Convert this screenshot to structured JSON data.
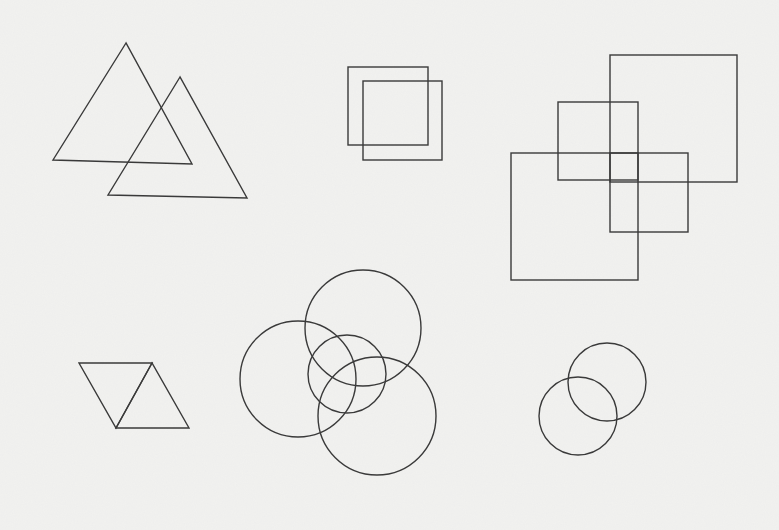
{
  "canvas": {
    "width": 779,
    "height": 530,
    "background": "#f2f2f0",
    "stroke_color": "#3a3a3a"
  },
  "groups": [
    {
      "name": "overlapping-triangles",
      "triangles": [
        {
          "points": "126,43 53,160 192,164"
        },
        {
          "points": "180,77 108,195 247,198"
        }
      ]
    },
    {
      "name": "overlapping-squares-small",
      "rects": [
        {
          "x": 348,
          "y": 67,
          "w": 80,
          "h": 78
        },
        {
          "x": 363,
          "y": 81,
          "w": 79,
          "h": 79
        }
      ]
    },
    {
      "name": "overlapping-squares-four",
      "rects": [
        {
          "x": 610,
          "y": 55,
          "w": 127,
          "h": 127
        },
        {
          "x": 558,
          "y": 102,
          "w": 80,
          "h": 78
        },
        {
          "x": 610,
          "y": 153,
          "w": 78,
          "h": 79
        },
        {
          "x": 511,
          "y": 153,
          "w": 127,
          "h": 127
        }
      ]
    },
    {
      "name": "adjacent-triangles",
      "triangles": [
        {
          "points": "79,363 152,363 116,428"
        },
        {
          "points": "152,363 116,428 189,428"
        }
      ]
    },
    {
      "name": "four-circles",
      "circles": [
        {
          "cx": 363,
          "cy": 328,
          "r": 58
        },
        {
          "cx": 298,
          "cy": 379,
          "r": 58
        },
        {
          "cx": 347,
          "cy": 374,
          "r": 39
        },
        {
          "cx": 377,
          "cy": 416,
          "r": 59
        }
      ]
    },
    {
      "name": "two-circles",
      "circles": [
        {
          "cx": 607,
          "cy": 382,
          "r": 39
        },
        {
          "cx": 578,
          "cy": 416,
          "r": 39
        }
      ]
    }
  ]
}
